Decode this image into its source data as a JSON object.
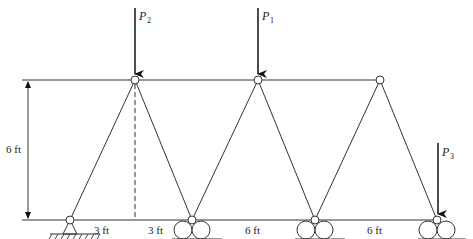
{
  "diagram": {
    "type": "truss",
    "loads": [
      {
        "id": "P2",
        "symbol": "P",
        "subscript": "2"
      },
      {
        "id": "P1",
        "symbol": "P",
        "subscript": "1"
      },
      {
        "id": "P3",
        "symbol": "P",
        "subscript": "3"
      }
    ],
    "dimensions": {
      "height": "6 ft",
      "bottom_segments": [
        "3 ft",
        "3 ft",
        "6 ft",
        "6 ft"
      ]
    },
    "supports": [
      {
        "type": "pin",
        "node": "bottom-left"
      },
      {
        "type": "roller",
        "node": "bottom-2"
      },
      {
        "type": "roller",
        "node": "bottom-3"
      },
      {
        "type": "roller",
        "node": "bottom-right"
      }
    ],
    "colors": {
      "line": "#333333",
      "background": "#ffffff"
    }
  }
}
